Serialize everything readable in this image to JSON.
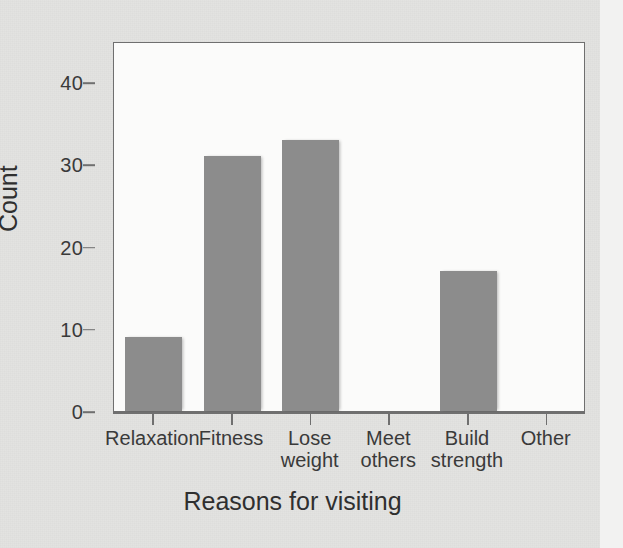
{
  "chart_data": {
    "type": "bar",
    "title": "",
    "xlabel": "Reasons for visiting",
    "ylabel": "Count",
    "categories": [
      "Relaxation",
      "Fitness",
      "Lose\nweight",
      "Meet\nothers",
      "Build\nstrength",
      "Other"
    ],
    "values": [
      9,
      31,
      33,
      0,
      17,
      0
    ],
    "ylim": [
      0,
      45
    ],
    "yticks": [
      0,
      10,
      20,
      30,
      40
    ],
    "ytick_labels": [
      "0",
      "10",
      "20",
      "30",
      "40"
    ],
    "grid": false,
    "legend": null,
    "bar_color": "#8c8c8c",
    "frame_color": "#6f6f6f",
    "plot_background": "#fbfbfa",
    "page_background": "#e3e3e1"
  },
  "axes": {
    "y_title": "Count",
    "x_title": "Reasons for visiting"
  }
}
